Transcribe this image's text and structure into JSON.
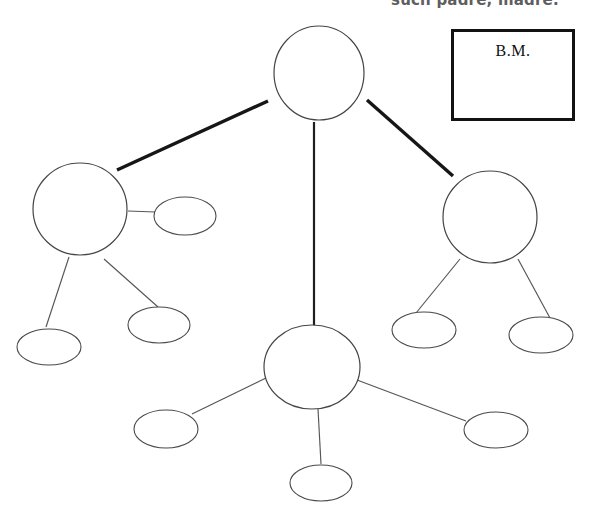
{
  "page": {
    "width": 599,
    "height": 527,
    "background_color": "#ffffff"
  },
  "clipped_heading": {
    "text": "such padre, madre.",
    "note": "cut off at the top edge of the page"
  },
  "legend_box": {
    "label": "B.M.",
    "border_color": "#121212",
    "fill_color": "#ffffff",
    "x": 451,
    "y": 29,
    "width": 124,
    "height": 92
  },
  "diagram": {
    "type": "concept-map",
    "stroke_color": "#4a4a4a",
    "link_color": "#161616",
    "nodes": [
      {
        "id": "root",
        "name": "root-node",
        "label": "",
        "shape": "ellipse",
        "cx": 319,
        "cy": 73,
        "rx": 45,
        "ry": 47,
        "size": "major"
      },
      {
        "id": "branch-left",
        "name": "left-branch-node",
        "label": "",
        "shape": "ellipse",
        "cx": 80,
        "cy": 209,
        "rx": 47,
        "ry": 46,
        "size": "major"
      },
      {
        "id": "branch-right",
        "name": "right-branch-node",
        "label": "",
        "shape": "ellipse",
        "cx": 490,
        "cy": 217,
        "rx": 47,
        "ry": 46,
        "size": "major"
      },
      {
        "id": "branch-mid",
        "name": "center-branch-node",
        "label": "",
        "shape": "ellipse",
        "cx": 312,
        "cy": 367,
        "rx": 48,
        "ry": 42,
        "size": "major"
      },
      {
        "id": "leaf-l-side",
        "name": "left-side-leaf",
        "label": "",
        "shape": "ellipse",
        "cx": 185,
        "cy": 216,
        "rx": 31,
        "ry": 19,
        "size": "leaf"
      },
      {
        "id": "leaf-l-1",
        "name": "left-lower-leaf-1",
        "label": "",
        "shape": "ellipse",
        "cx": 49,
        "cy": 347,
        "rx": 32,
        "ry": 18,
        "size": "leaf"
      },
      {
        "id": "leaf-l-2",
        "name": "left-lower-leaf-2",
        "label": "",
        "shape": "ellipse",
        "cx": 159,
        "cy": 325,
        "rx": 31,
        "ry": 18,
        "size": "leaf"
      },
      {
        "id": "leaf-r-1",
        "name": "right-lower-leaf-1",
        "label": "",
        "shape": "ellipse",
        "cx": 424,
        "cy": 330,
        "rx": 32,
        "ry": 18,
        "size": "leaf"
      },
      {
        "id": "leaf-r-2",
        "name": "right-lower-leaf-2",
        "label": "",
        "shape": "ellipse",
        "cx": 541,
        "cy": 335,
        "rx": 32,
        "ry": 18,
        "size": "leaf"
      },
      {
        "id": "leaf-m-1",
        "name": "center-lower-leaf-left",
        "label": "",
        "shape": "ellipse",
        "cx": 166,
        "cy": 429,
        "rx": 32,
        "ry": 19,
        "size": "leaf"
      },
      {
        "id": "leaf-m-2",
        "name": "center-lower-leaf-right",
        "label": "",
        "shape": "ellipse",
        "cx": 496,
        "cy": 430,
        "rx": 32,
        "ry": 18,
        "size": "leaf"
      },
      {
        "id": "leaf-m-3",
        "name": "center-bottom-leaf",
        "label": "",
        "shape": "ellipse",
        "cx": 321,
        "cy": 483,
        "rx": 31,
        "ry": 18,
        "size": "leaf"
      }
    ],
    "links": [
      {
        "name": "link-root-to-left",
        "from": "root",
        "to": "branch-left",
        "x1": 268,
        "y1": 101,
        "x2": 117,
        "y2": 170,
        "weight": "thick"
      },
      {
        "name": "link-root-to-right",
        "from": "root",
        "to": "branch-right",
        "x1": 367,
        "y1": 100,
        "x2": 453,
        "y2": 176,
        "weight": "thick"
      },
      {
        "name": "link-root-to-center",
        "from": "root",
        "to": "branch-mid",
        "x1": 314,
        "y1": 122,
        "x2": 314,
        "y2": 326,
        "weight": "medium"
      },
      {
        "name": "link-left-to-side-leaf",
        "from": "branch-left",
        "to": "leaf-l-side",
        "x1": 128,
        "y1": 211,
        "x2": 155,
        "y2": 212,
        "weight": "thin"
      },
      {
        "name": "link-left-to-leaf-1",
        "from": "branch-left",
        "to": "leaf-l-1",
        "x1": 69,
        "y1": 257,
        "x2": 46,
        "y2": 327,
        "weight": "thin"
      },
      {
        "name": "link-left-to-leaf-2",
        "from": "branch-left",
        "to": "leaf-l-2",
        "x1": 104,
        "y1": 259,
        "x2": 158,
        "y2": 307,
        "weight": "thin"
      },
      {
        "name": "link-right-to-leaf-1",
        "from": "branch-right",
        "to": "leaf-r-1",
        "x1": 460,
        "y1": 259,
        "x2": 416,
        "y2": 313,
        "weight": "thin"
      },
      {
        "name": "link-right-to-leaf-2",
        "from": "branch-right",
        "to": "leaf-r-2",
        "x1": 518,
        "y1": 259,
        "x2": 550,
        "y2": 318,
        "weight": "thin"
      },
      {
        "name": "link-center-to-leaf-left",
        "from": "branch-mid",
        "to": "leaf-m-1",
        "x1": 268,
        "y1": 377,
        "x2": 192,
        "y2": 414,
        "weight": "thin"
      },
      {
        "name": "link-center-to-leaf-right",
        "from": "branch-mid",
        "to": "leaf-m-2",
        "x1": 357,
        "y1": 380,
        "x2": 466,
        "y2": 421,
        "weight": "thin"
      },
      {
        "name": "link-center-to-bottom",
        "from": "branch-mid",
        "to": "leaf-m-3",
        "x1": 318,
        "y1": 409,
        "x2": 321,
        "y2": 464,
        "weight": "thin"
      }
    ]
  }
}
